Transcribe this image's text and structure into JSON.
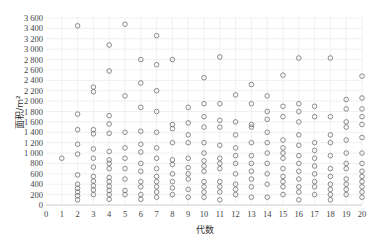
{
  "chart_data": {
    "type": "scatter",
    "title": "",
    "xlabel": "代数",
    "ylabel": "面积/m²",
    "xlim": [
      0,
      20
    ],
    "ylim": [
      0,
      3600
    ],
    "x_ticks": [
      0,
      1,
      2,
      3,
      4,
      5,
      6,
      7,
      8,
      9,
      10,
      11,
      12,
      13,
      14,
      15,
      16,
      17,
      18,
      19,
      20
    ],
    "y_ticks": [
      0,
      200,
      400,
      600,
      800,
      1000,
      1200,
      1400,
      1600,
      1800,
      2000,
      2200,
      2400,
      2600,
      2800,
      3000,
      3200,
      3400,
      3600
    ],
    "y_tick_labels": [
      "0",
      "200",
      "400",
      "600",
      "800",
      "1 000",
      "1 200",
      "1 400",
      "1 600",
      "1 800",
      "2 000",
      "2 200",
      "2 400",
      "2 600",
      "2 800",
      "3 000",
      "3 200",
      "3 400",
      "3 600"
    ],
    "grid": true,
    "legend": null,
    "marker": "open-circle",
    "series": [
      {
        "name": "面积",
        "points": [
          {
            "x": 1,
            "y": [
              900
            ]
          },
          {
            "x": 2,
            "y": [
              3450,
              1750,
              1450,
              1170,
              980,
              580,
              400,
              320,
              250,
              180,
              100
            ]
          },
          {
            "x": 3,
            "y": [
              2270,
              2180,
              1450,
              1370,
              1080,
              900,
              730,
              550,
              460,
              370,
              290,
              200
            ]
          },
          {
            "x": 4,
            "y": [
              3080,
              2580,
              1720,
              1560,
              1380,
              1030,
              870,
              800,
              700,
              530,
              450,
              360,
              280,
              200,
              110
            ]
          },
          {
            "x": 5,
            "y": [
              3480,
              2100,
              1400,
              1100,
              900,
              700,
              500,
              280,
              200
            ]
          },
          {
            "x": 6,
            "y": [
              2800,
              2350,
              1880,
              1420,
              1170,
              1020,
              800,
              650,
              450,
              350,
              200,
              110
            ]
          },
          {
            "x": 7,
            "y": [
              3260,
              2700,
              2200,
              1800,
              1400,
              1100,
              900,
              700,
              550,
              450,
              350,
              250,
              150
            ]
          },
          {
            "x": 8,
            "y": [
              2800,
              1550,
              1470,
              1200,
              870,
              780,
              600,
              450,
              330,
              200
            ]
          },
          {
            "x": 9,
            "y": [
              1880,
              1580,
              1350,
              1200,
              900,
              720,
              600,
              500,
              300,
              150
            ]
          },
          {
            "x": 10,
            "y": [
              2450,
              1950,
              1700,
              1500,
              1200,
              1000,
              850,
              750,
              650,
              450,
              350,
              250,
              150
            ]
          },
          {
            "x": 11,
            "y": [
              2850,
              1950,
              1630,
              1500,
              1150,
              900,
              800,
              700,
              450,
              350,
              250,
              100
            ]
          },
          {
            "x": 12,
            "y": [
              2120,
              1600,
              1350,
              1100,
              950,
              800,
              600,
              400,
              300,
              200
            ]
          },
          {
            "x": 13,
            "y": [
              2320,
              1950,
              1550,
              1500,
              1200,
              950,
              800,
              650,
              500,
              350,
              150
            ]
          },
          {
            "x": 14,
            "y": [
              2100,
              1800,
              1650,
              1400,
              1200,
              1000,
              800,
              600,
              400,
              150
            ]
          },
          {
            "x": 15,
            "y": [
              2500,
              1900,
              1700,
              1250,
              1100,
              1000,
              900,
              700,
              550,
              450,
              350,
              200
            ]
          },
          {
            "x": 16,
            "y": [
              2830,
              1950,
              1800,
              1600,
              1350,
              1150,
              950,
              800,
              650,
              500,
              350,
              250,
              100
            ]
          },
          {
            "x": 17,
            "y": [
              1900,
              1700,
              1200,
              1050,
              900,
              750,
              600,
              450,
              350,
              200
            ]
          },
          {
            "x": 18,
            "y": [
              2830,
              1700,
              1350,
              1200,
              950,
              700,
              550,
              400,
              300,
              200,
              100
            ]
          },
          {
            "x": 19,
            "y": [
              2030,
              1850,
              1600,
              1500,
              1250,
              1000,
              800,
              700,
              500,
              400,
              300,
              200
            ]
          },
          {
            "x": 20,
            "y": [
              2480,
              2060,
              1850,
              1700,
              1550,
              1300,
              1000,
              800,
              650,
              550,
              450,
              350,
              250,
              150
            ]
          }
        ]
      }
    ]
  },
  "colors": {
    "marker": "#707070",
    "grid": "#e6e6e6",
    "axis": "#bfbfbf",
    "text": "#444444"
  }
}
